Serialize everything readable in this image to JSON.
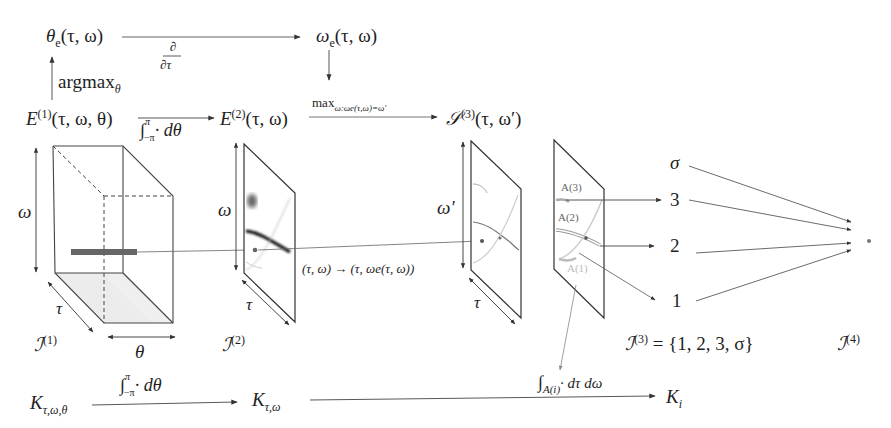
{
  "top_row": {
    "theta_e": "θ",
    "theta_e_sub": "e",
    "theta_e_args": "(τ, ω)",
    "d_dtau_num": "∂",
    "d_dtau_den": "∂τ",
    "omega_e": "ω",
    "omega_e_sub": "e",
    "omega_e_args": "(τ, ω)",
    "argmax": "argmax",
    "argmax_sub": "θ"
  },
  "middle_row": {
    "E1": "E",
    "E1_sup": "(1)",
    "E1_args": "(τ, ω, θ)",
    "integral_theta": "∫",
    "integral_theta_upper": "π",
    "integral_theta_lower": "−π",
    "integral_theta_body": "· dθ",
    "E2": "E",
    "E2_sup": "(2)",
    "E2_args": "(τ, ω)",
    "max_label": "max",
    "max_sub": "ω:ωe(τ,ω)=ω′",
    "S3": "𝒮",
    "S3_sup": "(3)",
    "S3_args": "(τ, ω′)"
  },
  "panels": {
    "cube_axis_omega": "ω",
    "cube_axis_tau": "τ",
    "cube_axis_theta": "θ",
    "I1": "ℐ",
    "I1_sup": "(1)",
    "panel2_axis_omega": "ω",
    "panel2_axis_tau": "τ",
    "I2": "ℐ",
    "I2_sup": "(2)",
    "mapping": "(τ, ω) → (τ, ωe(τ, ω))",
    "panel3_axis_omega": "ω′",
    "panel3_axis_tau": "τ",
    "regions": [
      "A(3)",
      "A(2)",
      "A(1)"
    ],
    "outputs": [
      "σ",
      "3",
      "2",
      "1"
    ],
    "I3": "ℐ",
    "I3_sup": "(3)",
    "I3_set": " = {1, 2, 3, σ}",
    "I4": "ℐ",
    "I4_sup": "(4)"
  },
  "bottom_row": {
    "K1": "K",
    "K1_sub": "τ,ω,θ",
    "integral_theta": "∫",
    "integral_upper": "π",
    "integral_lower": "−π",
    "integral_body": "· dθ",
    "K2": "K",
    "K2_sub": "τ,ω",
    "integral_region": "∫",
    "integral_region_sub": "A(i)",
    "integral_region_body": "· dτ dω",
    "Ki": "K",
    "Ki_sub": "i"
  },
  "colors": {
    "stroke": "#333333",
    "faint": "#9a9a9a",
    "bar": "#666666",
    "floor": "#ececec"
  }
}
